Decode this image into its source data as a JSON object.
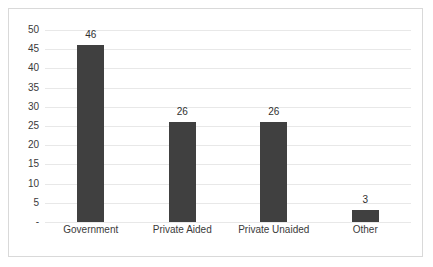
{
  "chart_data": {
    "type": "bar",
    "title": "",
    "xlabel": "",
    "ylabel": "",
    "categories": [
      "Government",
      "Private Aided",
      "Private Unaided",
      "Other"
    ],
    "values": [
      46,
      26,
      26,
      3
    ],
    "value_labels": [
      "46",
      "26",
      "26",
      "3"
    ],
    "ylim": [
      0,
      50
    ],
    "ytick_values": [
      50,
      45,
      40,
      35,
      30,
      25,
      20,
      15,
      10,
      5,
      0
    ],
    "ytick_labels": [
      "50",
      "45",
      "40",
      "35",
      "30",
      "25",
      "20",
      "15",
      "10",
      "5",
      "-"
    ],
    "grid": "horizontal",
    "legend": "none",
    "bar_color": "#404040",
    "gridline_color": "#e8e8e8",
    "border_color": "#d9d9d9",
    "text_color": "#3a3a3a",
    "background_color": "#ffffff"
  }
}
